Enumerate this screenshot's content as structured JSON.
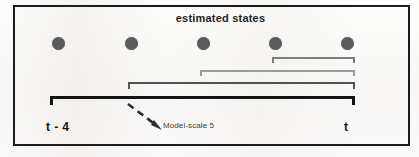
{
  "figure": {
    "title": "estimated states",
    "annotation": "Model-scale 5",
    "axis_labels": {
      "left": "t - 4",
      "right": "t"
    },
    "frame_color": "#1c1c1c",
    "background_color": "#ffffff"
  },
  "diagram_data": {
    "type": "timeline-bracket-diagram",
    "state_dots": {
      "count": 5,
      "color": "#5b5b5b",
      "diameter_px": 13,
      "x_centers": [
        58,
        131,
        203,
        275,
        347
      ],
      "y_center": 43
    },
    "brackets": [
      {
        "name": "model-scale-2",
        "start_x": 272,
        "end_x": 355,
        "y": 57,
        "thickness": 2.0,
        "color": "#7d7d7d",
        "spans_dots": 2
      },
      {
        "name": "model-scale-3",
        "start_x": 200,
        "end_x": 355,
        "y": 70,
        "thickness": 2.0,
        "color": "#9c9c9c",
        "spans_dots": 3
      },
      {
        "name": "model-scale-4",
        "start_x": 128,
        "end_x": 355,
        "y": 82,
        "thickness": 2.4,
        "color": "#545454",
        "spans_dots": 4
      },
      {
        "name": "model-scale-5",
        "start_x": 50,
        "end_x": 355,
        "y": 96,
        "thickness": 3.4,
        "color": "#141414",
        "spans_dots": 5
      }
    ],
    "arrow": {
      "style": "dashed",
      "from": [
        130,
        106
      ],
      "to": [
        160,
        128
      ],
      "points_to": "model-scale-5",
      "color": "#2e2e2e"
    }
  }
}
